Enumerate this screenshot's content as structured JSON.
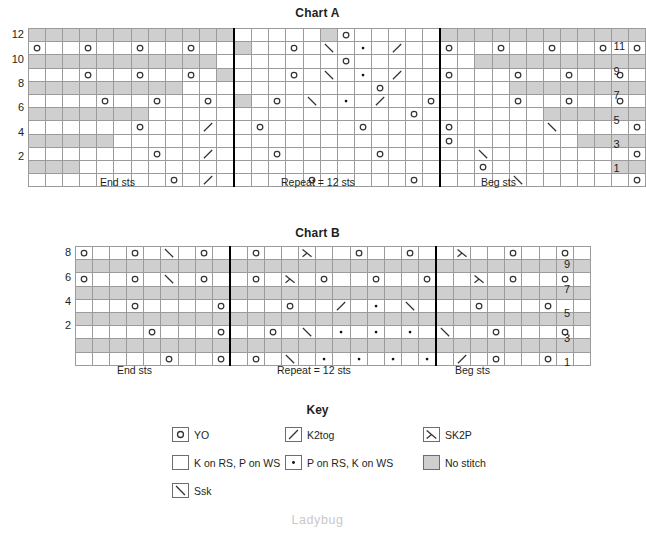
{
  "charts": [
    {
      "id": "chart-a",
      "title": "Chart A",
      "rows": 12,
      "cols": 36,
      "repeat_start_col": 12,
      "repeat_end_col": 24,
      "row_labels_left": [
        "12",
        "10",
        "8",
        "6",
        "4",
        "2"
      ],
      "row_labels_right": [
        "11",
        "9",
        "7",
        "5",
        "3",
        "1"
      ],
      "section_labels": [
        {
          "text": "End sts",
          "center_col": 6
        },
        {
          "text": "Repeat = 12 sts",
          "center_col": 18
        },
        {
          "text": "Beg sts",
          "center_col": 30
        }
      ],
      "grid": [
        "NNNNNNNNNNNN.....no.....kkkkkkkkkkkk",
        "o..o..o..o..N..o.S.P.K..o..o..o..o.o",
        "XXXXXXXXXXX.......o.......kkkkkkkkkk",
        "...o..o..o.N...o.S.P.K..o...o..o..o.",
        "XXXXXXXXX...........o.......kkkkkkkk",
        "....o..o..o.N.o.S.P.K..o....o..o..o.",
        "XXXXXXX...............o.......kkkkkk",
        "......o...K..o.....o....o.....S....o",
        "XXXXX...................o.......kkkk",
        ".......o..K...o.....o.....S........o",
        "XXX.......................o.......kk",
        "........o.K.....o.....o.....S......o"
      ]
    },
    {
      "id": "chart-b",
      "title": "Chart B",
      "rows": 9,
      "cols": 30,
      "repeat_start_col": 9,
      "repeat_end_col": 21,
      "row_labels_left": [
        "8",
        "6",
        "4",
        "2"
      ],
      "row_labels_right": [
        "9",
        "7",
        "5",
        "3",
        "1"
      ],
      "section_labels": [
        {
          "text": "End sts",
          "center_col": 4.5
        },
        {
          "text": "Repeat = 12 sts",
          "center_col": 15
        },
        {
          "text": "Beg sts",
          "center_col": 25.5
        }
      ],
      "grid": [
        "o..o S o..o..T..o..o..T..o..o o..o",
        "NNNNNNNNNNNNNNNNNNNNNNNNNNNNNN",
        "o..o S o..o T o..o..o..T o..o..o",
        "NNNNNNNNNNNNNNNNNNNNNNNNNNNNNN",
        "...o....o...o..K P S...o...o...o",
        "NNNNNNNNNNNNNNNNNNNNNNNNNNNNNN",
        "....o...o..o S P P P S..o...o..o",
        "NNNNNNNNNNNNNNNNNNNNNNNNNNNNNN",
        ".....o..o.o.S P P P P K o..o..o"
      ]
    }
  ],
  "key": {
    "title": "Key",
    "items": [
      {
        "symbol": "yo",
        "label": "YO",
        "col": 0,
        "row": 0
      },
      {
        "symbol": "k2tog",
        "label": "K2tog",
        "col": 1,
        "row": 0
      },
      {
        "symbol": "sk2p",
        "label": "SK2P",
        "col": 2,
        "row": 0
      },
      {
        "symbol": "knit",
        "label": "K on RS, P on WS",
        "col": 0,
        "row": 1
      },
      {
        "symbol": "purl",
        "label": "P on RS, K on WS",
        "col": 1,
        "row": 1
      },
      {
        "symbol": "nostitch",
        "label": "No stitch",
        "col": 2,
        "row": 1
      },
      {
        "symbol": "ssk",
        "label": "Ssk",
        "col": 0,
        "row": 2
      }
    ]
  },
  "watermark": "Ladybug",
  "colors": {
    "no_stitch_fill": "#cfcfcf",
    "grid_line": "#9b9b9b",
    "separator": "#000000",
    "text": "#231f20",
    "watermark": "#c9c9c9"
  },
  "chart_data": {
    "type": "table",
    "symbols_legend": [
      "YO",
      "K2tog",
      "SK2P",
      "K on RS, P on WS",
      "P on RS, K on WS",
      "No stitch",
      "Ssk"
    ],
    "chart_a": {
      "rows": 12,
      "cols": 36,
      "repeat_sts": 12,
      "row_numbers_left": [
        12,
        10,
        8,
        6,
        4,
        2
      ],
      "row_numbers_right": [
        11,
        9,
        7,
        5,
        3,
        1
      ],
      "sections": [
        "End sts",
        "Repeat = 12 sts",
        "Beg sts"
      ],
      "cells": [
        {
          "row": 12,
          "symbols": [
            {
              "c": 0,
              "s": "nostitch",
              "span": 12
            },
            {
              "c": 17,
              "s": "yo"
            }
          ]
        },
        {
          "row": 11,
          "symbols": [
            {
              "c": 0,
              "s": "yo"
            },
            {
              "c": 3,
              "s": "yo"
            },
            {
              "c": 6,
              "s": "yo"
            },
            {
              "c": 9,
              "s": "yo"
            },
            {
              "c": 15,
              "s": "yo"
            },
            {
              "c": 17,
              "s": "ssk"
            },
            {
              "c": 18,
              "s": "purl"
            },
            {
              "c": 19,
              "s": "k2tog"
            },
            {
              "c": 22,
              "s": "yo"
            },
            {
              "c": 26,
              "s": "yo"
            },
            {
              "c": 29,
              "s": "yo"
            },
            {
              "c": 32,
              "s": "yo"
            },
            {
              "c": 35,
              "s": "yo"
            }
          ]
        },
        {
          "row": 10,
          "symbols": [
            {
              "c": 0,
              "s": "nostitch",
              "span": 11
            },
            {
              "c": 25,
              "s": "nostitch",
              "span": 11
            }
          ]
        },
        {
          "row": 9,
          "symbols": [
            {
              "c": 3,
              "s": "yo"
            },
            {
              "c": 6,
              "s": "yo"
            },
            {
              "c": 9,
              "s": "yo"
            },
            {
              "c": 15,
              "s": "yo"
            },
            {
              "c": 17,
              "s": "ssk"
            },
            {
              "c": 18,
              "s": "purl"
            },
            {
              "c": 19,
              "s": "k2tog"
            },
            {
              "c": 22,
              "s": "yo"
            },
            {
              "c": 26,
              "s": "yo"
            },
            {
              "c": 29,
              "s": "yo"
            },
            {
              "c": 32,
              "s": "yo"
            }
          ]
        },
        {
          "row": 8,
          "symbols": [
            {
              "c": 0,
              "s": "nostitch",
              "span": 9
            },
            {
              "c": 27,
              "s": "nostitch",
              "span": 9
            }
          ]
        },
        {
          "row": 7,
          "symbols": [
            {
              "c": 4,
              "s": "yo"
            },
            {
              "c": 7,
              "s": "yo"
            },
            {
              "c": 10,
              "s": "yo"
            },
            {
              "c": 12,
              "s": "yo"
            },
            {
              "c": 17,
              "s": "ssk"
            },
            {
              "c": 18,
              "s": "purl"
            },
            {
              "c": 19,
              "s": "k2tog"
            },
            {
              "c": 23,
              "s": "yo"
            },
            {
              "c": 25,
              "s": "yo"
            },
            {
              "c": 28,
              "s": "yo"
            },
            {
              "c": 31,
              "s": "yo"
            }
          ]
        },
        {
          "row": 6,
          "symbols": [
            {
              "c": 0,
              "s": "nostitch",
              "span": 7
            },
            {
              "c": 29,
              "s": "nostitch",
              "span": 7
            }
          ]
        },
        {
          "row": 5,
          "symbols": [
            {
              "c": 6,
              "s": "yo"
            },
            {
              "c": 10,
              "s": "k2tog"
            },
            {
              "c": 13,
              "s": "yo"
            },
            {
              "c": 19,
              "s": "yo"
            },
            {
              "c": 24,
              "s": "yo"
            },
            {
              "c": 25,
              "s": "ssk"
            },
            {
              "c": 29,
              "s": "yo"
            }
          ]
        },
        {
          "row": 4,
          "symbols": [
            {
              "c": 0,
              "s": "nostitch",
              "span": 5
            },
            {
              "c": 31,
              "s": "nostitch",
              "span": 5
            }
          ]
        },
        {
          "row": 3,
          "symbols": [
            {
              "c": 7,
              "s": "yo"
            },
            {
              "c": 10,
              "s": "k2tog"
            },
            {
              "c": 14,
              "s": "yo"
            },
            {
              "c": 20,
              "s": "yo"
            },
            {
              "c": 26,
              "s": "ssk"
            },
            {
              "c": 28,
              "s": "yo"
            }
          ]
        },
        {
          "row": 2,
          "symbols": [
            {
              "c": 0,
              "s": "nostitch",
              "span": 3
            },
            {
              "c": 33,
              "s": "nostitch",
              "span": 3
            }
          ]
        },
        {
          "row": 1,
          "symbols": [
            {
              "c": 8,
              "s": "yo"
            },
            {
              "c": 10,
              "s": "k2tog"
            },
            {
              "c": 16,
              "s": "yo"
            },
            {
              "c": 22,
              "s": "yo"
            },
            {
              "c": 28,
              "s": "ssk"
            },
            {
              "c": 27,
              "s": "yo"
            }
          ]
        }
      ]
    },
    "chart_b": {
      "rows": 9,
      "cols": 30,
      "repeat_sts": 12,
      "row_numbers_left": [
        8,
        6,
        4,
        2
      ],
      "row_numbers_right": [
        9,
        7,
        5,
        3,
        1
      ],
      "sections": [
        "End sts",
        "Repeat = 12 sts",
        "Beg sts"
      ]
    }
  }
}
